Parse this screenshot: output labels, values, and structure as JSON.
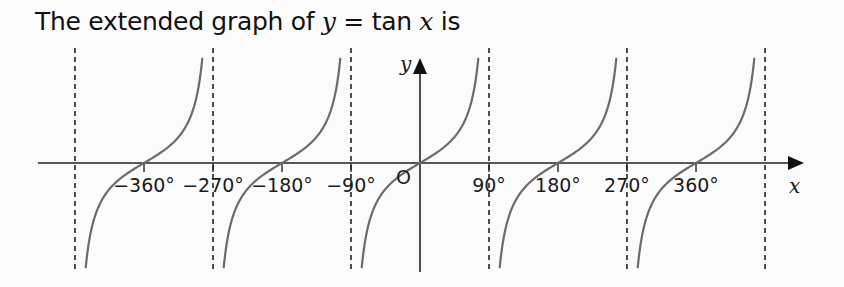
{
  "title": {
    "prefix": "The extended graph of ",
    "var_y": "y",
    "equals": " = ",
    "func": "tan ",
    "var_x": "x",
    "suffix": " is"
  },
  "axes": {
    "x_label": "x",
    "y_label": "y",
    "origin_label": "O"
  },
  "colors": {
    "curve": "#6b6b6b",
    "axis": "#222222",
    "asymptote": "#222222",
    "background": "#fbfbfb"
  },
  "chart_data": {
    "type": "line",
    "title": "The extended graph of y = tan x",
    "xlabel": "x",
    "ylabel": "y",
    "function": "y = tan x",
    "xlim_degrees": [
      -450,
      450
    ],
    "x_tick_labels": [
      "−360°",
      "−270°",
      "−180°",
      "−90°",
      "90°",
      "180°",
      "270°",
      "360°"
    ],
    "x_tick_values": [
      -360,
      -270,
      -180,
      -90,
      90,
      180,
      270,
      360
    ],
    "asymptotes_degrees": [
      -450,
      -270,
      -90,
      90,
      270,
      450
    ],
    "zeros_degrees": [
      -360,
      -180,
      0,
      180,
      360
    ],
    "branches": [
      {
        "from": -450,
        "to": -270,
        "zero": -360
      },
      {
        "from": -270,
        "to": -90,
        "zero": -180
      },
      {
        "from": -90,
        "to": 90,
        "zero": 0
      },
      {
        "from": 90,
        "to": 270,
        "zero": 180
      },
      {
        "from": 270,
        "to": 450,
        "zero": 360
      }
    ],
    "grid": false,
    "legend": null
  }
}
